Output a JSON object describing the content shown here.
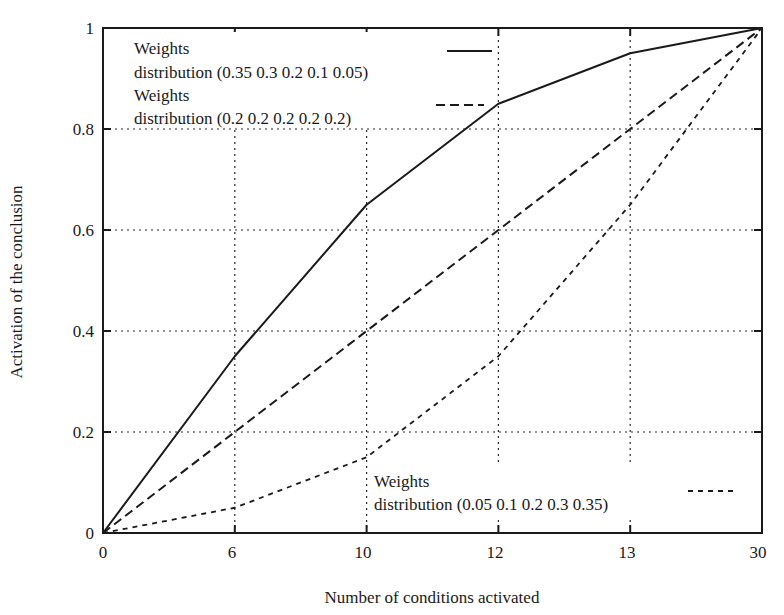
{
  "chart_data": {
    "type": "line",
    "title": "",
    "xlabel": "Number of conditions activated",
    "ylabel": "Activation of the conclusion",
    "x_categories": [
      "0",
      "6",
      "10",
      "12",
      "13",
      "30"
    ],
    "x_note": "x-axis ticks are equally spaced (categorical positions)",
    "yticks": [
      "0",
      "0.2",
      "0.4",
      "0.6",
      "0.8",
      "1"
    ],
    "ylim": [
      0,
      1
    ],
    "grid": true,
    "series": [
      {
        "name": "Weights distribution (0.35 0.3 0.2 0.1 0.05)",
        "legend_line1": "Weights",
        "legend_line2": "distribution (0.35 0.3 0.2 0.1 0.05)",
        "style": "solid",
        "values": [
          0,
          0.35,
          0.65,
          0.85,
          0.95,
          1
        ]
      },
      {
        "name": "Weights distribution (0.2 0.2 0.2 0.2 0.2)",
        "legend_line1": "Weights",
        "legend_line2": "distribution (0.2 0.2 0.2 0.2 0.2)",
        "style": "dashed",
        "values": [
          0,
          0.2,
          0.4,
          0.6,
          0.8,
          1
        ]
      },
      {
        "name": "Weights distribution (0.05 0.1 0.2 0.3 0.35)",
        "legend_line1": "Weights",
        "legend_line2": "distribution (0.05 0.1 0.2 0.3 0.35)",
        "style": "dotted",
        "values": [
          0,
          0.05,
          0.15,
          0.35,
          0.65,
          1
        ]
      }
    ]
  },
  "axes": {
    "x_label": "Number of conditions activated",
    "y_label": "Activation of the conclusion",
    "x_ticks": [
      "0",
      "6",
      "10",
      "12",
      "13",
      "30"
    ],
    "y_ticks": [
      "0",
      "0.2",
      "0.4",
      "0.6",
      "0.8",
      "1"
    ],
    "y_tick_left_origin": "0",
    "x_tick_origin": "0"
  },
  "legend": {
    "entry1": {
      "line1": "Weights",
      "line2": "distribution (0.35 0.3 0.2 0.1 0.05)"
    },
    "entry2": {
      "line1": "Weights",
      "line2": "distribution (0.2 0.2 0.2 0.2 0.2)"
    },
    "entry3": {
      "line1": "Weights",
      "line2": "distribution (0.05 0.1 0.2 0.3 0.35)"
    }
  },
  "colors": {
    "ink": "#1a1a1a",
    "background": "#ffffff"
  }
}
